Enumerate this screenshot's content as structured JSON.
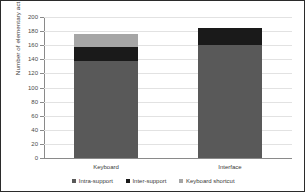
{
  "chart_data": {
    "type": "bar",
    "subtype": "stacked-vertical",
    "title": "",
    "xlabel": "",
    "ylabel": "Number of elementary actions",
    "categories": [
      "Keyboard",
      "Interface"
    ],
    "ylim": [
      0,
      200
    ],
    "yticks": [
      200,
      180,
      160,
      140,
      120,
      100,
      80,
      60,
      40,
      20,
      0
    ],
    "ytick_labels": [
      "200",
      "180",
      "160",
      "140",
      "120",
      "100",
      "80",
      "60",
      "40",
      "20",
      "0"
    ],
    "grid": true,
    "legend_position": "bottom",
    "series": [
      {
        "name": "Intra-support",
        "color": "#595959",
        "values": [
          137,
          160
        ]
      },
      {
        "name": "Inter-support",
        "color": "#1a1a1a",
        "values": [
          20,
          25
        ]
      },
      {
        "name": "Keyboard shortcut",
        "color": "#a6a6a6",
        "values": [
          19,
          0
        ]
      }
    ],
    "totals": [
      176,
      185
    ]
  },
  "axis": {
    "y_title": "Number of elementary actions"
  },
  "legend": {
    "items": [
      {
        "label": "Intra-support",
        "color": "#595959"
      },
      {
        "label": "Inter-support",
        "color": "#1a1a1a"
      },
      {
        "label": "Keyboard shortcut",
        "color": "#a6a6a6"
      }
    ]
  },
  "xaxis": {
    "labels": [
      "Keyboard",
      "Interface"
    ]
  }
}
